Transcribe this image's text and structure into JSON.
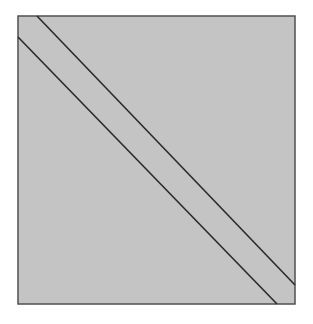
{
  "diagram": {
    "canvas": {
      "width": 313,
      "height": 324,
      "background": "#ffffff"
    },
    "square": {
      "x": 18,
      "y": 16,
      "width": 277,
      "height": 288,
      "fill": "#c4c4c4",
      "stroke": "#505050",
      "stroke_width": 1.5
    },
    "lines": [
      {
        "name": "upper-diagonal",
        "x1": 37,
        "y1": 16,
        "x2": 295,
        "y2": 285,
        "stroke": "#2a2a2a",
        "stroke_width": 1.6
      },
      {
        "name": "lower-diagonal",
        "x1": 18,
        "y1": 37,
        "x2": 277,
        "y2": 304,
        "stroke": "#2a2a2a",
        "stroke_width": 1.6
      }
    ],
    "measurement_note": "Coordinates read approximately from 3x zoom crops (about +/-2px) and then idealized into a symmetric layout; not exact pixel measurements."
  }
}
